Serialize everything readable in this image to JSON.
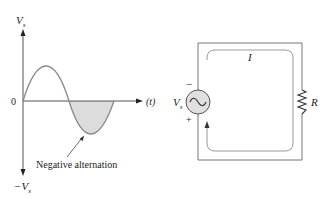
{
  "waveform": {
    "y_axis_top_label": "V",
    "y_axis_top_sub": "s",
    "y_axis_bottom_label": "−V",
    "y_axis_bottom_sub": "s",
    "origin_label": "0",
    "x_axis_label": "(t)",
    "annotation": "Negative alternation",
    "colors": {
      "curve": "#8a8a8a",
      "fill": "#dcdcdc",
      "axis": "#555555"
    }
  },
  "circuit": {
    "source_label": "V",
    "source_sub": "s",
    "source_minus": "−",
    "source_plus": "+",
    "current_label": "I",
    "resistor_label": "R",
    "colors": {
      "wire": "#777777",
      "source_fill": "#e0e0e0",
      "loop": "#999999"
    }
  }
}
